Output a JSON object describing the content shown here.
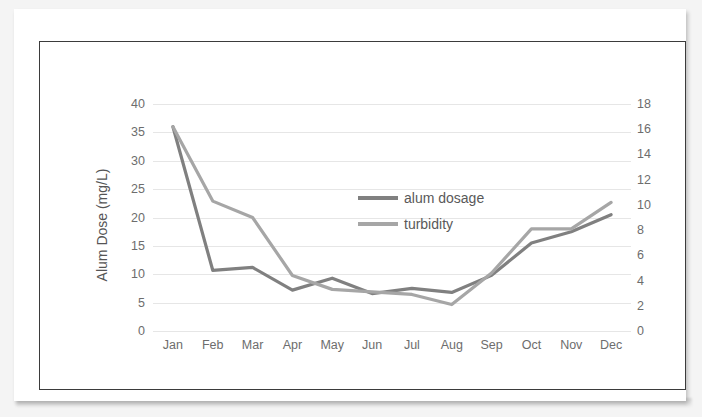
{
  "chart_data": {
    "type": "line",
    "title": "",
    "xlabel": "",
    "categories": [
      "Jan",
      "Feb",
      "Mar",
      "Apr",
      "May",
      "Jun",
      "Jul",
      "Aug",
      "Sep",
      "Oct",
      "Nov",
      "Dec"
    ],
    "grid": true,
    "legend_position": "inside-top-center",
    "axes": {
      "left": {
        "label": "Alum Dose (mg/L)",
        "ylim": [
          0,
          40
        ],
        "ticks": [
          0,
          5,
          10,
          15,
          20,
          25,
          30,
          35,
          40
        ]
      },
      "right": {
        "label": "Turbidity (NTU)",
        "ylim": [
          0,
          18
        ],
        "ticks": [
          0,
          2,
          4,
          6,
          8,
          10,
          12,
          14,
          16,
          18
        ]
      }
    },
    "series": [
      {
        "name": "alum dosage",
        "axis": "left",
        "unit": "mg/L",
        "color": "#808080",
        "values": [
          36.0,
          10.7,
          11.2,
          7.2,
          9.3,
          6.6,
          7.5,
          6.8,
          9.8,
          15.5,
          17.5,
          20.5
        ]
      },
      {
        "name": "turbidity",
        "axis": "right",
        "unit": "NTU",
        "color": "#a6a6a6",
        "values": [
          16.2,
          10.3,
          9.0,
          4.4,
          3.3,
          3.1,
          2.9,
          2.1,
          4.6,
          8.1,
          8.1,
          10.2
        ]
      }
    ]
  },
  "legend": {
    "items": [
      {
        "label": "alum dosage",
        "color": "#808080"
      },
      {
        "label": "turbidity",
        "color": "#a6a6a6"
      }
    ]
  }
}
